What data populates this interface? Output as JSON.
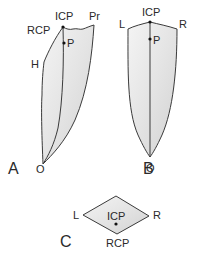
{
  "figure": {
    "panels": [
      {
        "id": "A",
        "label": "A",
        "view": "sagittal tracing",
        "points": {
          "icp": "ICP",
          "p": "P",
          "pr": "Pr",
          "rcp": "RCP",
          "h": "H",
          "o": "O"
        }
      },
      {
        "id": "B",
        "label": "B",
        "view": "frontal tracing",
        "points": {
          "icp": "ICP",
          "p": "P",
          "l": "L",
          "r": "R",
          "o": "O"
        }
      },
      {
        "id": "C",
        "label": "C",
        "view": "horizontal tracing",
        "points": {
          "icp": "ICP",
          "rcp": "RCP",
          "l": "L",
          "r": "R"
        }
      }
    ]
  },
  "colors": {
    "stroke": "#3a3a3a",
    "fill_light": "#f2f2f2",
    "fill_dark": "#d4d4d4",
    "text": "#2a2a2a"
  }
}
